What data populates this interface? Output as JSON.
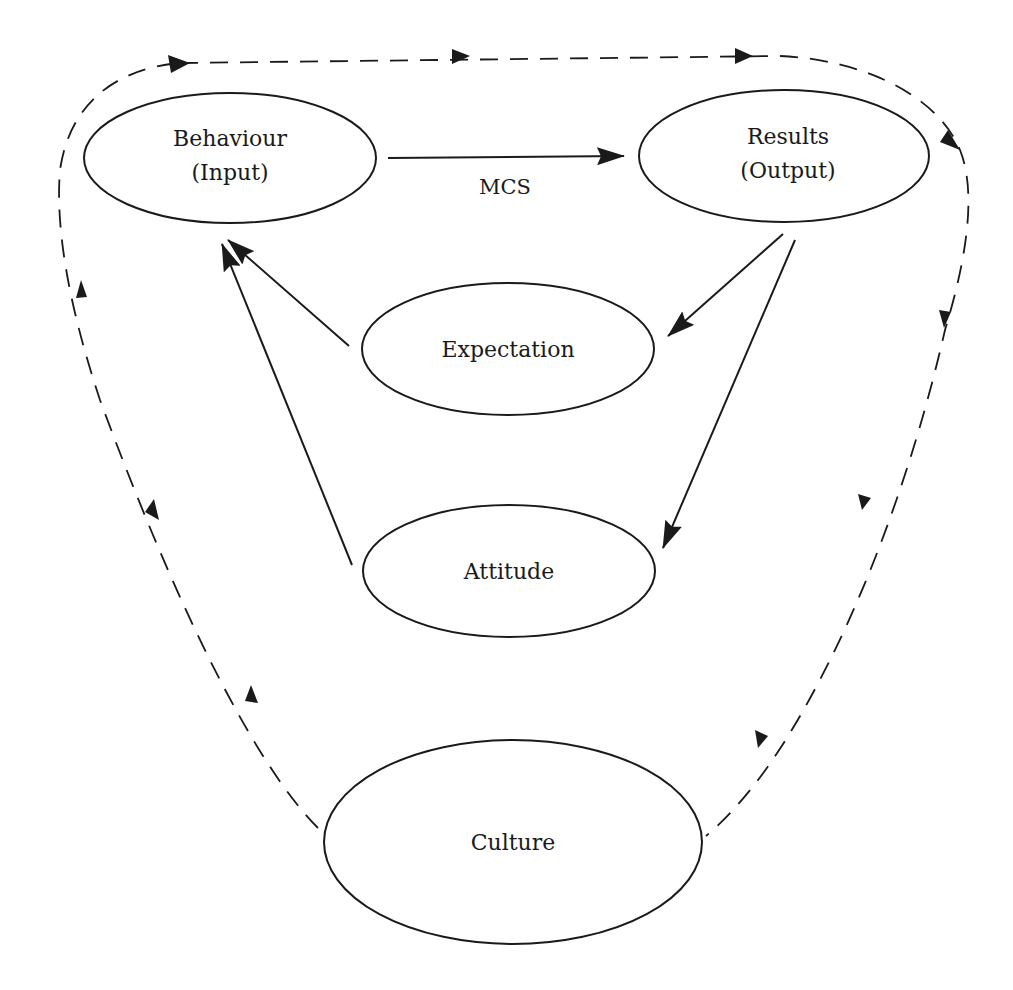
{
  "diagram": {
    "nodes": {
      "behaviour": {
        "line1": "Behaviour",
        "line2": "(Input)"
      },
      "results": {
        "line1": "Results",
        "line2": "(Output)"
      },
      "expectation": {
        "label": "Expectation"
      },
      "attitude": {
        "label": "Attitude"
      },
      "culture": {
        "label": "Culture"
      }
    },
    "edges": {
      "behaviour_to_results": {
        "label": "MCS"
      },
      "results_to_expectation": {
        "label": ""
      },
      "results_to_attitude": {
        "label": ""
      },
      "expectation_to_behaviour": {
        "label": ""
      },
      "attitude_to_behaviour": {
        "label": ""
      },
      "culture_loop": {
        "style": "dashed",
        "direction": "Culture → Behaviour → Results → Culture"
      }
    },
    "colors": {
      "stroke": "#1a1a1a",
      "background": "#ffffff"
    }
  }
}
